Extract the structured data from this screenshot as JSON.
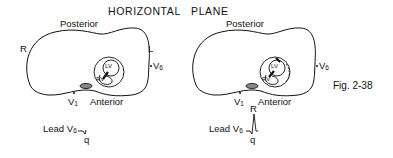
{
  "title": "HORIZONTAL   PLANE",
  "figure_label": "Fig. 2-38",
  "panels": [
    {
      "posterior": "Posterior",
      "anterior": "Anterior",
      "right_label": "R",
      "left_label": "L",
      "v6_label": "V",
      "v6_sub": "6",
      "v1_label": "V",
      "v1_sub": "1",
      "lv_label": "LV",
      "rv_label": "RV",
      "lead_label": "Lead V",
      "lead_sub": "6",
      "wave_q": "q"
    },
    {
      "posterior": "Posterior",
      "anterior": "Anterior",
      "v6_label": "V",
      "v6_sub": "6",
      "v1_label": "V",
      "v1_sub": "1",
      "lv_label": "LV",
      "rv_label": "RV",
      "lead_label": "Lead V",
      "lead_sub": "6",
      "wave_r": "R",
      "wave_q": "q"
    }
  ]
}
